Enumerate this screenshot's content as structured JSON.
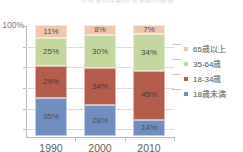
{
  "title": "世帯主の年齢別世帯数の推移",
  "axis": {
    "y_labels": [
      "100%"
    ],
    "y_tick_count": 6,
    "x_labels": [
      "1990",
      "2000",
      "2010"
    ]
  },
  "legend": {
    "position": "right",
    "items": [
      {
        "label": "65歳以上",
        "color": "#f2c6ab"
      },
      {
        "label": "35-64歳",
        "color": "#c3d69b"
      },
      {
        "label": "18-34歳",
        "color": "#b35c4a"
      },
      {
        "label": "18歳未満",
        "color": "#6f8fc0"
      }
    ]
  },
  "chart_data": {
    "type": "bar",
    "variant": "100%-stacked-column",
    "title": "世帯主の年齢別世帯数の推移",
    "xlabel": "",
    "ylabel": "",
    "ylim": [
      0,
      100
    ],
    "grid": true,
    "legend_position": "right",
    "categories": [
      "1990",
      "2000",
      "2010"
    ],
    "stack_order_bottom_to_top": [
      "18歳未満",
      "18-34歳",
      "35-64歳",
      "65歳以上"
    ],
    "series": [
      {
        "name": "18歳未満",
        "color": "#6f8fc0",
        "values": [
          35,
          28,
          14
        ],
        "labels": [
          "35%",
          "28%",
          "14%"
        ]
      },
      {
        "name": "18-34歳",
        "color": "#b35c4a",
        "values": [
          29,
          34,
          45
        ],
        "labels": [
          "29%",
          "34%",
          "45%"
        ]
      },
      {
        "name": "35-64歳",
        "color": "#c3d69b",
        "values": [
          25,
          30,
          34
        ],
        "labels": [
          "25%",
          "30%",
          "34%"
        ]
      },
      {
        "name": "65歳以上",
        "color": "#f2c6ab",
        "values": [
          11,
          8,
          7
        ],
        "labels": [
          "11%",
          "8%",
          "7%"
        ]
      }
    ]
  },
  "colors": {
    "grid": "#dcdcdc",
    "axis": "#b8b8b8",
    "background": "#ffffff",
    "label_text": "#4c4c4c"
  }
}
